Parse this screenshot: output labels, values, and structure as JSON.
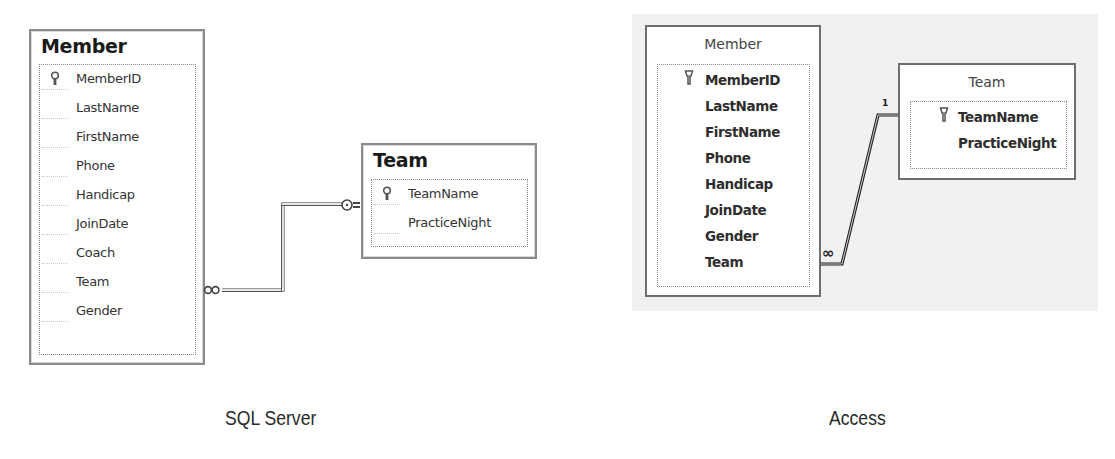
{
  "sql_server": {
    "caption": "SQL Server",
    "member_table": {
      "title": "Member",
      "fields": [
        {
          "name": "MemberID",
          "primary_key": true
        },
        {
          "name": "LastName",
          "primary_key": false
        },
        {
          "name": "FirstName",
          "primary_key": false
        },
        {
          "name": "Phone",
          "primary_key": false
        },
        {
          "name": "Handicap",
          "primary_key": false
        },
        {
          "name": "JoinDate",
          "primary_key": false
        },
        {
          "name": "Coach",
          "primary_key": false
        },
        {
          "name": "Team",
          "primary_key": false
        },
        {
          "name": "Gender",
          "primary_key": false
        }
      ]
    },
    "team_table": {
      "title": "Team",
      "fields": [
        {
          "name": "TeamName",
          "primary_key": true
        },
        {
          "name": "PracticeNight",
          "primary_key": false
        }
      ]
    },
    "relationship": {
      "from": "Member.Team",
      "to": "Team.TeamName",
      "many_end_symbol": "∞",
      "one_end_symbol": "key"
    }
  },
  "access": {
    "caption": "Access",
    "member_table": {
      "title": "Member",
      "fields": [
        {
          "name": "MemberID",
          "primary_key": true
        },
        {
          "name": "LastName",
          "primary_key": false
        },
        {
          "name": "FirstName",
          "primary_key": false
        },
        {
          "name": "Phone",
          "primary_key": false
        },
        {
          "name": "Handicap",
          "primary_key": false
        },
        {
          "name": "JoinDate",
          "primary_key": false
        },
        {
          "name": "Gender",
          "primary_key": false
        },
        {
          "name": "Team",
          "primary_key": false
        }
      ]
    },
    "team_table": {
      "title": "Team",
      "fields": [
        {
          "name": "TeamName",
          "primary_key": true
        },
        {
          "name": "PracticeNight",
          "primary_key": false
        }
      ]
    },
    "relationship": {
      "from": "Member.Team",
      "to": "Team.TeamName",
      "many_label": "∞",
      "one_label": "1"
    }
  }
}
